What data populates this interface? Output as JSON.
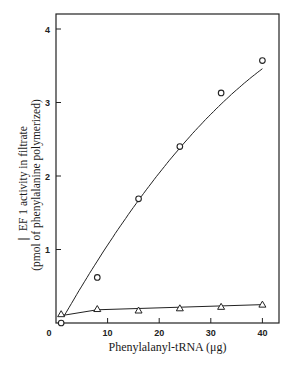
{
  "chart_data": {
    "type": "line",
    "title": "",
    "xlabel": "Phenylalanyl-tRNA (μg)",
    "ylabel_line1": "EF 1 activity in filtrate",
    "ylabel_line2": "(pmol of phenylalanine polymerized)",
    "xlim": [
      0,
      43
    ],
    "ylim": [
      0,
      4.2
    ],
    "xticks": [
      0,
      10,
      20,
      30,
      40
    ],
    "yticks": [
      1,
      2,
      3,
      4
    ],
    "grid": false,
    "legend": null,
    "series": [
      {
        "name": "circles",
        "marker": "circle",
        "x": [
          1,
          8,
          16,
          24,
          32,
          40
        ],
        "values": [
          0.0,
          0.62,
          1.69,
          2.4,
          3.13,
          3.57
        ]
      },
      {
        "name": "triangles",
        "marker": "triangle",
        "x": [
          1,
          8,
          16,
          24,
          32,
          40
        ],
        "values": [
          0.12,
          0.19,
          0.17,
          0.2,
          0.22,
          0.25
        ]
      }
    ]
  },
  "labels": {
    "ylabel_line1": "❘ EF 1 activity in filtrate",
    "ylabel_line2": "(pmol of phenylalanine polymerized)",
    "xlabel": "Phenylalanyl-tRNA (μg)"
  }
}
